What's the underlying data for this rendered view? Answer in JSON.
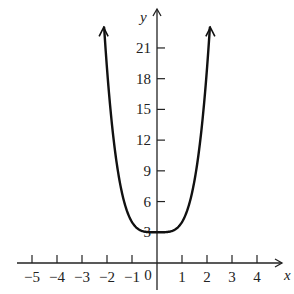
{
  "chart_data": {
    "type": "line",
    "title": "",
    "xlabel": "x",
    "ylabel": "y",
    "function": "y = x^4 + 3",
    "xlim": [
      -5.6,
      5
    ],
    "ylim": [
      0,
      23
    ],
    "x_ticks": [
      -5,
      -4,
      -3,
      -2,
      -1,
      1,
      2,
      3,
      4
    ],
    "x_tick_labels": [
      "−5",
      "−4",
      "−3",
      "−2",
      "−1",
      "1",
      "2",
      "3",
      "4"
    ],
    "origin_label": "0",
    "y_ticks": [
      3,
      6,
      9,
      12,
      15,
      18,
      21
    ],
    "y_tick_labels": [
      "3",
      "6",
      "9",
      "12",
      "15",
      "18",
      "21"
    ],
    "grid": false,
    "legend": "none",
    "series": [
      {
        "name": "y = x^4 + 3",
        "x": [
          -2.12,
          -2.0,
          -1.75,
          -1.5,
          -1.25,
          -1.0,
          -0.75,
          -0.5,
          -0.25,
          0,
          0.25,
          0.5,
          0.75,
          1.0,
          1.25,
          1.5,
          1.75,
          2.0,
          2.12
        ],
        "y": [
          23.2,
          19.0,
          12.38,
          8.06,
          5.44,
          4.0,
          3.32,
          3.06,
          3.0,
          3.0,
          3.0,
          3.06,
          3.32,
          4.0,
          5.44,
          8.06,
          12.38,
          19.0,
          23.2
        ],
        "arrows_at_ends": true
      }
    ]
  }
}
